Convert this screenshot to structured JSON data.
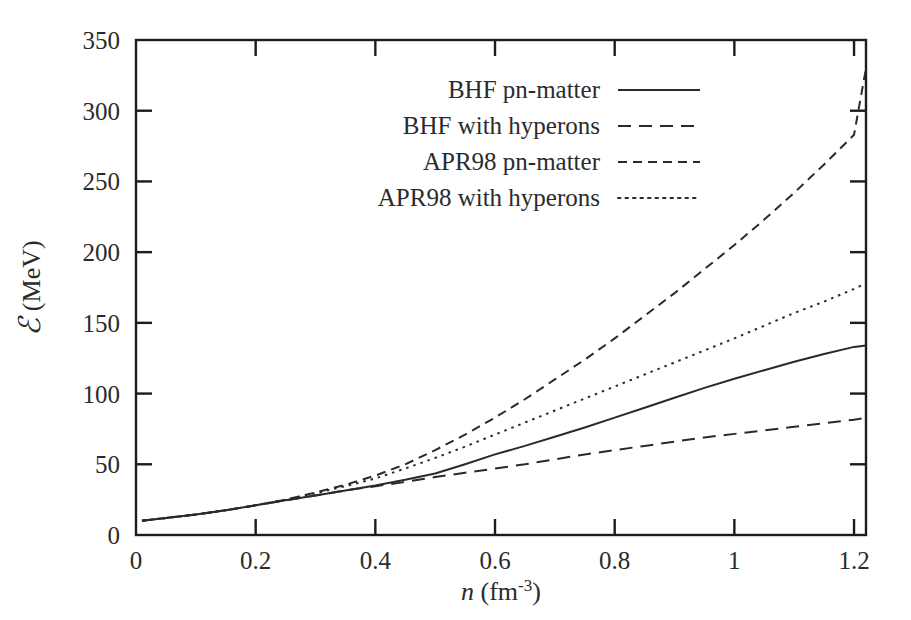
{
  "chart_data": {
    "type": "line",
    "title": "",
    "xlabel": "n (fm^-3)",
    "xlabel_parts": {
      "symbol": "n",
      "unit_open": " (fm",
      "unit_exp": "-3",
      "unit_close": ")"
    },
    "ylabel": "E (MeV)",
    "ylabel_parts": {
      "symbol": "ℰ",
      "unit": " (MeV)"
    },
    "xlim": [
      0,
      1.22
    ],
    "ylim": [
      0,
      350
    ],
    "xticks": [
      0,
      0.2,
      0.4,
      0.6,
      0.8,
      1,
      1.2
    ],
    "xtick_labels": [
      "0",
      "0.2",
      "0.4",
      "0.6",
      "0.8",
      "1",
      "1.2"
    ],
    "yticks": [
      0,
      50,
      100,
      150,
      200,
      250,
      300,
      350
    ],
    "ytick_labels": [
      "0",
      "50",
      "100",
      "150",
      "200",
      "250",
      "300",
      "350"
    ],
    "grid": false,
    "legend_position": "top-left-inside",
    "series": [
      {
        "name": "BHF pn-matter",
        "style": "solid",
        "dasharray": "none",
        "x": [
          0.01,
          0.05,
          0.1,
          0.15,
          0.2,
          0.25,
          0.3,
          0.35,
          0.4,
          0.45,
          0.5,
          0.55,
          0.6,
          0.65,
          0.7,
          0.75,
          0.8,
          0.85,
          0.9,
          0.95,
          1.0,
          1.05,
          1.1,
          1.15,
          1.2,
          1.22
        ],
        "y": [
          10,
          12,
          14.5,
          17.5,
          21,
          24.5,
          28,
          31.5,
          35,
          39,
          43.5,
          50,
          57,
          63,
          69.5,
          76,
          83,
          90,
          97,
          104,
          110.5,
          116.5,
          122.5,
          128,
          133,
          134
        ]
      },
      {
        "name": "BHF with hyperons",
        "style": "dashed-long",
        "dasharray": "13,8",
        "x": [
          0.01,
          0.05,
          0.1,
          0.15,
          0.2,
          0.25,
          0.3,
          0.35,
          0.4,
          0.45,
          0.5,
          0.55,
          0.6,
          0.65,
          0.7,
          0.75,
          0.8,
          0.85,
          0.9,
          0.95,
          1.0,
          1.05,
          1.1,
          1.15,
          1.2,
          1.22
        ],
        "y": [
          10,
          12,
          14.5,
          17.5,
          21,
          24.5,
          28,
          31.5,
          34.5,
          37.5,
          41,
          44,
          47,
          50,
          53.5,
          57,
          60,
          63,
          66,
          69,
          71.5,
          74,
          76.5,
          79,
          81.5,
          83
        ]
      },
      {
        "name": "APR98 pn-matter",
        "style": "dashed-short",
        "dasharray": "9,6",
        "x": [
          0.01,
          0.05,
          0.1,
          0.15,
          0.2,
          0.25,
          0.3,
          0.35,
          0.4,
          0.45,
          0.5,
          0.55,
          0.6,
          0.65,
          0.7,
          0.75,
          0.8,
          0.85,
          0.9,
          0.95,
          1.0,
          1.05,
          1.1,
          1.15,
          1.2,
          1.22
        ],
        "y": [
          10,
          12,
          14.5,
          17.5,
          21,
          25,
          30,
          35.5,
          42,
          50,
          60,
          71,
          83,
          96,
          110,
          124,
          139,
          155,
          171,
          188,
          205,
          223,
          242,
          262,
          283,
          330
        ]
      },
      {
        "name": "APR98 with hyperons",
        "style": "dotted",
        "dasharray": "2.5,5",
        "x": [
          0.01,
          0.05,
          0.1,
          0.15,
          0.2,
          0.25,
          0.3,
          0.35,
          0.4,
          0.45,
          0.5,
          0.55,
          0.6,
          0.65,
          0.7,
          0.75,
          0.8,
          0.85,
          0.9,
          0.95,
          1.0,
          1.05,
          1.1,
          1.15,
          1.2,
          1.22
        ],
        "y": [
          10,
          12,
          14.5,
          17.5,
          21,
          25,
          29.5,
          34.5,
          40,
          47,
          54.5,
          62.5,
          71,
          79.5,
          88,
          96.5,
          105,
          113.5,
          122,
          130.5,
          139,
          148,
          157,
          165,
          174,
          178
        ]
      }
    ]
  },
  "legend": {
    "entries": [
      {
        "label": "BHF pn-matter",
        "style": "solid"
      },
      {
        "label": "BHF with hyperons",
        "style": "dashed-long"
      },
      {
        "label": "APR98 pn-matter",
        "style": "dashed-short"
      },
      {
        "label": "APR98 with hyperons",
        "style": "dotted"
      }
    ]
  }
}
